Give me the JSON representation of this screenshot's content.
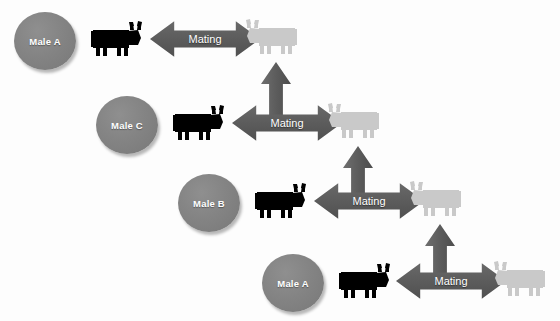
{
  "diagram": {
    "background_color": "#fdfdfd",
    "colors": {
      "male_circle": "#848484",
      "arrow": "#5c5c5c",
      "black_cow": "#000000",
      "gray_cow": "#c9c9c9",
      "label_text": "#ffffff"
    },
    "rows": [
      {
        "male_label": "Male A",
        "mating_label": "Mating",
        "black_cow_name": "black-cow-icon",
        "gray_cow_name": "gray-cow-icon",
        "has_incoming_up_arrow": false
      },
      {
        "male_label": "Male C",
        "mating_label": "Mating",
        "black_cow_name": "black-cow-icon",
        "gray_cow_name": "gray-cow-icon",
        "has_incoming_up_arrow": true
      },
      {
        "male_label": "Male B",
        "mating_label": "Mating",
        "black_cow_name": "black-cow-icon",
        "gray_cow_name": "gray-cow-icon",
        "has_incoming_up_arrow": true
      },
      {
        "male_label": "Male A",
        "mating_label": "Mating",
        "black_cow_name": "black-cow-icon",
        "gray_cow_name": "gray-cow-icon",
        "has_incoming_up_arrow": true
      }
    ]
  }
}
